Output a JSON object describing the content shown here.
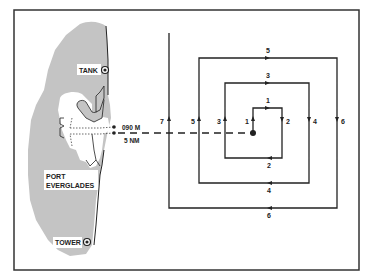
{
  "diagram": {
    "type": "expanding-square-search-pattern",
    "colors": {
      "land": "#c4c4c4",
      "line": "#222222",
      "background": "#ffffff"
    },
    "landmarks": {
      "tank": "TANK",
      "port": [
        "PORT",
        "EVERGLADES"
      ],
      "tower": "TOWER"
    },
    "datum": {
      "bearing": "090 M",
      "distance": "5 NM"
    },
    "legs": {
      "top": [
        "1",
        "3",
        "5"
      ],
      "right": [
        "2",
        "4",
        "6"
      ],
      "bottom": [
        "2",
        "4",
        "6"
      ],
      "left": [
        "1",
        "3",
        "5",
        "7"
      ]
    }
  }
}
